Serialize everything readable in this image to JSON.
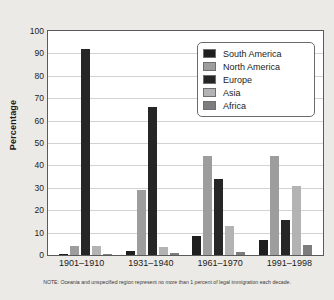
{
  "chart_data": {
    "type": "bar",
    "title": "",
    "xlabel": "",
    "ylabel": "Percentage",
    "ylim": [
      0,
      100
    ],
    "ytick_step": 10,
    "yticks": [
      100,
      90,
      80,
      70,
      60,
      50,
      40,
      30,
      20,
      10,
      0
    ],
    "grid": true,
    "legend_position": "top-right",
    "categories": [
      "1901–1910",
      "1931–1940",
      "1961–1970",
      "1991–1998"
    ],
    "series": [
      {
        "name": "South America",
        "color": "#1f1f1f",
        "values": [
          0.5,
          2.0,
          8.5,
          6.5
        ]
      },
      {
        "name": "North America",
        "color": "#9d9d9d",
        "values": [
          4.0,
          29.0,
          44.0,
          44.0
        ]
      },
      {
        "name": "Europe",
        "color": "#262626",
        "values": [
          92.0,
          66.0,
          34.0,
          15.5
        ]
      },
      {
        "name": "Asia",
        "color": "#b3b3b3",
        "values": [
          4.0,
          3.5,
          13.0,
          31.0
        ]
      },
      {
        "name": "Africa",
        "color": "#7d7d7d",
        "values": [
          0.3,
          0.8,
          1.5,
          4.5
        ]
      }
    ],
    "note": "NOTE: Oceania and unspecified region represent no more than 1 percent of legal immigration each decade."
  }
}
